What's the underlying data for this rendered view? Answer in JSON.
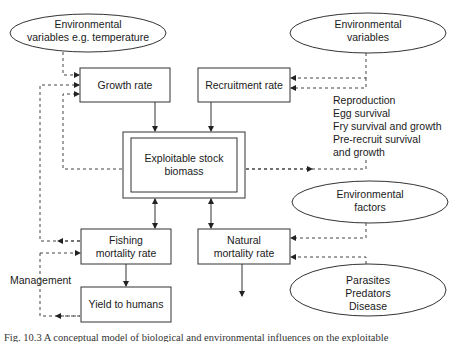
{
  "diagram": {
    "nodes": {
      "env_temp": {
        "line1": "Environmental",
        "line2": "variables e.g. temperature"
      },
      "env_vars": {
        "line1": "Environmental",
        "line2": "variables"
      },
      "growth": {
        "label": "Growth rate"
      },
      "recruitment": {
        "label": "Recruitment rate"
      },
      "stock": {
        "line1": "Exploitable stock",
        "line2": "biomass"
      },
      "fishing": {
        "line1": "Fishing",
        "line2": "mortality rate"
      },
      "natural": {
        "line1": "Natural",
        "line2": "mortality rate"
      },
      "yield": {
        "label": "Yield to humans"
      },
      "env_factors": {
        "line1": "Environmental",
        "line2": "factors"
      },
      "biotic": {
        "line1": "Parasites",
        "line2": "Predators",
        "line3": "Disease"
      }
    },
    "recruitment_notes": [
      "Reproduction",
      "Egg survival",
      "Fry survival and growth",
      "Pre-recruit survival",
      "and growth"
    ],
    "management_label": "Management",
    "caption": "Fig. 10.3   A conceptual model of biological and environmental influences on the exploitable"
  }
}
